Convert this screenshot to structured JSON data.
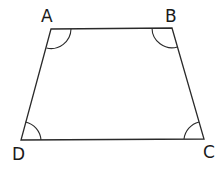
{
  "diagram": {
    "type": "quadrilateral-trapezium",
    "stroke_color": "#2a2a2a",
    "vertices": [
      {
        "label": "A",
        "x": 51,
        "y": 29
      },
      {
        "label": "B",
        "x": 172,
        "y": 28
      },
      {
        "label": "C",
        "x": 204,
        "y": 139
      },
      {
        "label": "D",
        "x": 21,
        "y": 140
      }
    ],
    "angle_marks": [
      "A",
      "B",
      "C",
      "D"
    ],
    "labels": {
      "a": "A",
      "b": "B",
      "c": "C",
      "d": "D"
    }
  }
}
